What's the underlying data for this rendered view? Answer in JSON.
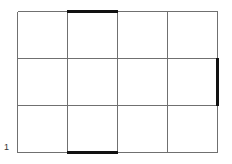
{
  "figure": {
    "background_color": "#ffffff",
    "width": 232,
    "height": 164,
    "grid": {
      "columns": 4,
      "rows": 3,
      "left": 17,
      "top": 11,
      "right": 218,
      "bottom": 152,
      "column_edges": [
        17,
        67,
        117,
        167,
        218
      ],
      "row_edges": [
        11,
        58,
        105,
        152
      ],
      "line_color": "#707070",
      "line_width": 1
    },
    "emphasis": {
      "color": "#111111",
      "line_width": 2.6,
      "segments": [
        {
          "name": "column-2-top-edge",
          "orientation": "horizontal",
          "x1": 67,
          "y1": 11,
          "x2": 117,
          "y2": 11
        },
        {
          "name": "column-2-bottom-edge",
          "orientation": "horizontal",
          "x1": 67,
          "y1": 152,
          "x2": 117,
          "y2": 152
        },
        {
          "name": "middle-right-cell-right-edge",
          "orientation": "vertical",
          "x1": 218,
          "y1": 58,
          "x2": 218,
          "y2": 105
        }
      ]
    },
    "labels": {
      "corner": {
        "text": "1",
        "x": 4,
        "y": 143
      }
    }
  }
}
